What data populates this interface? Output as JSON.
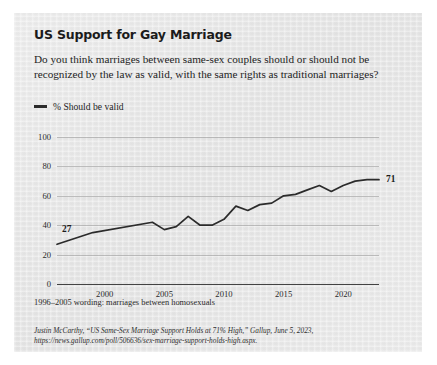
{
  "card": {
    "title": "US Support for Gay Marriage",
    "subtitle": "Do you think marriages between same-sex couples should or should not be recognized by the law as valid, with the same rights as traditional marriages?",
    "footnote": "1996–2005 wording: marriages between homosexuals",
    "source_line1": "Justin McCarthy, “US Same-Sex Marriage Support Holds at 71% High,” Gallup, June 5, 2023,",
    "source_line2": "https://news.gallup.com/poll/506636/sex-marriage-support-holds-high.aspx."
  },
  "colors": {
    "line": "#2b2b2b",
    "grid": "#9a9a9a",
    "axis": "#3a3a3a",
    "card_bg": "#e8e8e8",
    "text": "#1d1d1d"
  },
  "chart_data": {
    "type": "line",
    "title": "US Support for Gay Marriage",
    "xlabel": "",
    "ylabel": "",
    "ylim": [
      0,
      100
    ],
    "xlim": [
      1996,
      2023
    ],
    "grid": true,
    "legend_position": "top-left",
    "yticks": [
      0,
      20,
      40,
      60,
      80,
      100
    ],
    "xticks": [
      2000,
      2005,
      2010,
      2015,
      2020
    ],
    "start_label": "27",
    "end_label": "71",
    "series": [
      {
        "name": "% Should be valid",
        "x": [
          1996,
          1999,
          2004,
          2005,
          2006,
          2007,
          2008,
          2009,
          2010,
          2011,
          2012,
          2013,
          2014,
          2015,
          2016,
          2017,
          2018,
          2019,
          2020,
          2021,
          2022,
          2023
        ],
        "values": [
          27,
          35,
          42,
          37,
          39,
          46,
          40,
          40,
          44,
          53,
          50,
          54,
          55,
          60,
          61,
          64,
          67,
          63,
          67,
          70,
          71,
          71
        ]
      }
    ]
  }
}
